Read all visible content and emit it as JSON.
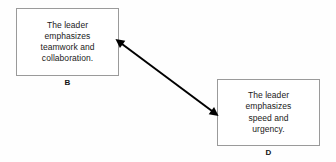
{
  "diagram": {
    "background_color": "#fefefe",
    "nodes": [
      {
        "id": "B",
        "label": "B",
        "text": "The leader\nemphasizes\nteamwork and\ncollaboration.",
        "border_color": "#9a9a9a",
        "fill_color": "#ffffff"
      },
      {
        "id": "D",
        "label": "D",
        "text": "The leader\nemphasizes\nspeed and\nurgency.",
        "border_color": "#9a9a9a",
        "fill_color": "#ffffff"
      }
    ],
    "connector": {
      "type": "double-headed-arrow",
      "color": "#000000",
      "from_node": "B",
      "to_node": "D",
      "start_x": 122,
      "start_y": 44,
      "end_x": 212,
      "end_y": 111,
      "line_width": 2
    }
  }
}
